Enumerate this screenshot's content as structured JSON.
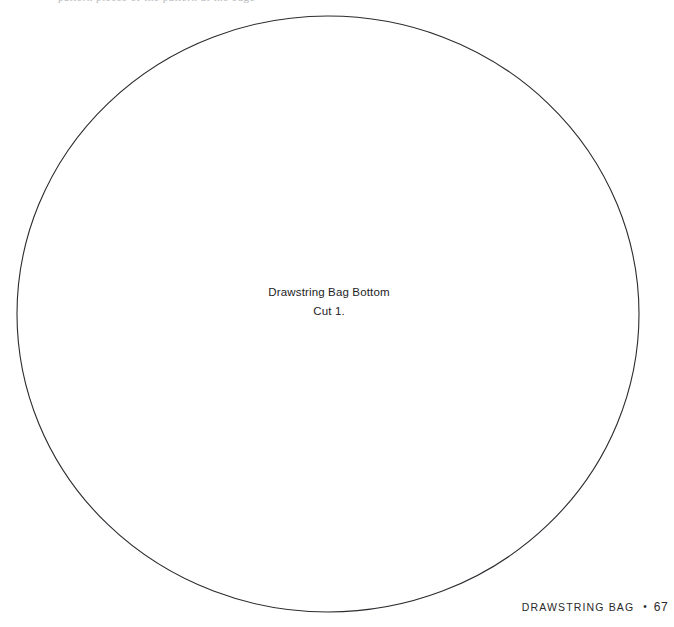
{
  "page": {
    "background_color": "#ffffff",
    "width": 674,
    "height": 627
  },
  "bleed_text": {
    "content": "pattern pieces of the pattern at the edge"
  },
  "pattern": {
    "shape": "circle",
    "stroke_color": "#2b2b30",
    "stroke_width": 1,
    "fill": "none",
    "geometry": {
      "cx": 328,
      "cy": 314,
      "rx": 311,
      "ry": 298
    },
    "label": {
      "line1": "Drawstring Bag Bottom",
      "line2": "Cut 1."
    }
  },
  "footer": {
    "chapter": "DRAWSTRING BAG",
    "separator": "•",
    "page_number": "67"
  }
}
